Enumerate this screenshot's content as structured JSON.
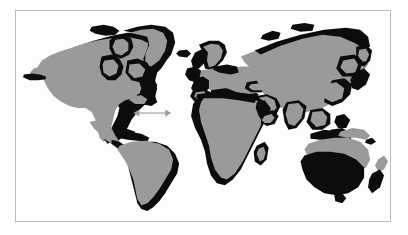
{
  "figure": {
    "kind": "world-map",
    "title": "",
    "caption": "",
    "background_color": "#ffffff",
    "panel_background_color": "#fdfdfd",
    "border_color": "#bcbcbc"
  },
  "legend_colors": {
    "land_fill": "#9a9a9a",
    "highlight_fill": "#0c0c0c",
    "ocean_fill": "#fdfdfd",
    "arrow_color": "#9a9a9a"
  },
  "annotations": [
    {
      "name": "atlantic-double-arrow",
      "type": "double-headed-arrow",
      "label": "",
      "x1": 118,
      "y1": 103,
      "x2": 156,
      "y2": 103
    }
  ],
  "regions": [
    {
      "name": "north-america",
      "shading": "gray-with-black-coast"
    },
    {
      "name": "greenland",
      "shading": "gray-with-black-coast"
    },
    {
      "name": "canadian-arctic",
      "shading": "gray-with-black-coast"
    },
    {
      "name": "central-america",
      "shading": "gray-with-black-coast"
    },
    {
      "name": "caribbean",
      "shading": "black"
    },
    {
      "name": "south-america",
      "shading": "gray-with-black-coast"
    },
    {
      "name": "europe",
      "shading": "gray-with-black-coast"
    },
    {
      "name": "scandinavia",
      "shading": "gray-with-black-coast"
    },
    {
      "name": "british-isles",
      "shading": "black"
    },
    {
      "name": "iceland",
      "shading": "black"
    },
    {
      "name": "africa",
      "shading": "gray-with-black-coast"
    },
    {
      "name": "madagascar",
      "shading": "black"
    },
    {
      "name": "asia",
      "shading": "gray-with-black-coast"
    },
    {
      "name": "middle-east",
      "shading": "gray-with-black-coast"
    },
    {
      "name": "india",
      "shading": "gray-with-black-coast"
    },
    {
      "name": "southeast-asia",
      "shading": "black"
    },
    {
      "name": "japan",
      "shading": "black"
    },
    {
      "name": "indonesia",
      "shading": "black"
    },
    {
      "name": "new-guinea",
      "shading": "gray"
    },
    {
      "name": "australia",
      "shading": "black-south-gray-north"
    },
    {
      "name": "new-zealand",
      "shading": "black-and-gray"
    }
  ]
}
